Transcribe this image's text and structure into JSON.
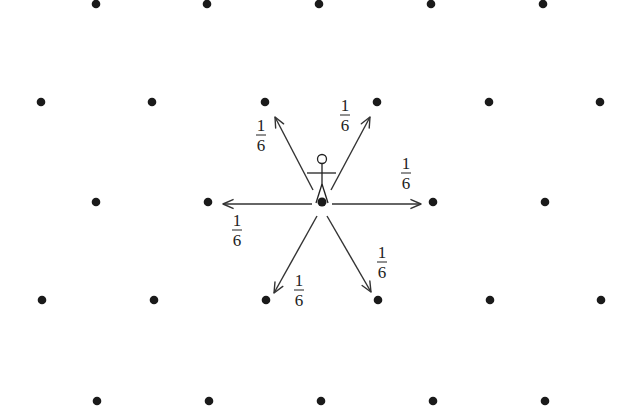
{
  "diagram": {
    "type": "random-walk-hexagonal-lattice",
    "colors": {
      "ink": "#1a1a1a",
      "background": "#ffffff"
    },
    "lattice_points": [
      [
        96,
        4
      ],
      [
        207,
        4
      ],
      [
        319,
        4
      ],
      [
        431,
        4
      ],
      [
        543,
        4
      ],
      [
        41,
        102
      ],
      [
        152,
        102
      ],
      [
        265,
        102
      ],
      [
        377,
        102
      ],
      [
        489,
        102
      ],
      [
        600,
        102
      ],
      [
        96,
        202
      ],
      [
        208,
        202
      ],
      [
        433,
        202
      ],
      [
        545,
        202
      ],
      [
        42,
        300
      ],
      [
        154,
        300
      ],
      [
        266,
        300
      ],
      [
        378,
        300
      ],
      [
        490,
        300
      ],
      [
        601,
        300
      ],
      [
        97,
        401
      ],
      [
        209,
        401
      ],
      [
        321,
        401
      ],
      [
        433,
        401
      ],
      [
        545,
        401
      ]
    ],
    "walker": {
      "position": [
        322,
        202
      ],
      "label": "walker-figure"
    },
    "transitions": [
      {
        "direction": "upper-left",
        "from": [
          313,
          190
        ],
        "to": [
          275,
          117
        ],
        "label": {
          "num": "1",
          "den": "6",
          "x": 261,
          "y": 137
        }
      },
      {
        "direction": "upper-right",
        "from": [
          331,
          190
        ],
        "to": [
          370,
          117
        ],
        "label": {
          "num": "1",
          "den": "6",
          "x": 345,
          "y": 117
        }
      },
      {
        "direction": "right",
        "from": [
          332,
          204
        ],
        "to": [
          421,
          204
        ],
        "label": {
          "num": "1",
          "den": "6",
          "x": 406,
          "y": 175
        }
      },
      {
        "direction": "left",
        "from": [
          312,
          204
        ],
        "to": [
          223,
          204
        ],
        "label": {
          "num": "1",
          "den": "6",
          "x": 237,
          "y": 232
        }
      },
      {
        "direction": "lower-left",
        "from": [
          317,
          216
        ],
        "to": [
          274,
          293
        ],
        "label": {
          "num": "1",
          "den": "6",
          "x": 299,
          "y": 292
        }
      },
      {
        "direction": "lower-right",
        "from": [
          327,
          216
        ],
        "to": [
          371,
          292
        ],
        "label": {
          "num": "1",
          "den": "6",
          "x": 382,
          "y": 264
        }
      }
    ]
  }
}
